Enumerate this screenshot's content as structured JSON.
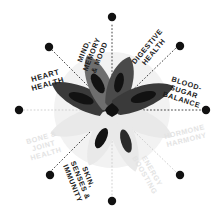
{
  "graphic": {
    "title": "Radial health benefits wheel",
    "center_motif": "eight-petal flower",
    "background_circle_color": "#f2f2f2",
    "active_label_color": "#1a1a1a",
    "faded_label_color": "#e3e3e3",
    "spoke_dot_color": "#111111",
    "segment_count": 8
  },
  "segments": [
    {
      "id": "mind-memory-mood",
      "label": "MIND, MEMORY & MOOD",
      "lines": [
        "MIND,",
        "MEMORY",
        "& MOOD"
      ],
      "state": "active",
      "angle_deg": -67.5,
      "petal_shade": "dark"
    },
    {
      "id": "digestive-health",
      "label": "DIGESTIVE HEALTH",
      "lines": [
        "DIGESTIVE",
        "HEALTH"
      ],
      "state": "active",
      "angle_deg": -45,
      "petal_shade": "dark"
    },
    {
      "id": "blood-sugar-balance",
      "label": "BLOOD-SUGAR BALANCE",
      "lines": [
        "BLOOD-",
        "SUGAR",
        "BALANCE"
      ],
      "state": "active",
      "angle_deg": -22.5,
      "petal_shade": "dark"
    },
    {
      "id": "hormone-harmony",
      "label": "HORMONE HARMONY",
      "lines": [
        "HORMONE",
        "HARMONY"
      ],
      "state": "faded",
      "angle_deg": 22.5,
      "petal_shade": "faint"
    },
    {
      "id": "energy-boosting",
      "label": "ENERGY BOOSTING",
      "lines": [
        "ENERGY",
        "BOOSTING"
      ],
      "state": "faded",
      "angle_deg": 45,
      "petal_shade": "faint"
    },
    {
      "id": "skin-senses-immunity",
      "label": "SKIN, SENSES & IMMUNITY",
      "lines": [
        "SKIN,",
        "SENSES &",
        "IMMUNITY"
      ],
      "state": "active",
      "angle_deg": 112.5,
      "petal_shade": "dark"
    },
    {
      "id": "bone-joint-health",
      "label": "BONE & JOINT HEALTH",
      "lines": [
        "BONE &",
        "JOINT",
        "HEALTH"
      ],
      "state": "faded",
      "angle_deg": 157.5,
      "petal_shade": "faint"
    },
    {
      "id": "heart-health",
      "label": "HEART HEALTH",
      "lines": [
        "HEART",
        "HEALTH"
      ],
      "state": "active",
      "angle_deg": 202.5,
      "petal_shade": "dark"
    }
  ]
}
